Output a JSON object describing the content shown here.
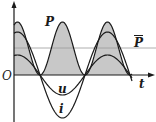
{
  "diagram": {
    "labels": {
      "origin": "O",
      "time_axis": "t",
      "power": "P",
      "average_power": "P",
      "voltage": "u",
      "current": "i"
    },
    "colors": {
      "curve": "#1a1a1a",
      "fill": "#c8c8c8",
      "avg_line": "#9a9a9a",
      "axis": "#1a1a1a"
    },
    "geometry": {
      "origin_x": 14,
      "axis_y": 75,
      "peak_x": 17.5,
      "half_period_px": 45,
      "x_end": 132,
      "power_peak_px": 53,
      "voltage_amp_px": 20,
      "current_amp_px": 43,
      "avg_power_y": 48
    }
  },
  "chart_data": {
    "type": "line",
    "title": "",
    "xlabel": "t",
    "ylabel": "",
    "series": [
      {
        "name": "u",
        "shape": "cosine",
        "amplitude_rel": 0.46
      },
      {
        "name": "i",
        "shape": "cosine, in phase with u",
        "amplitude_rel": 1.0
      },
      {
        "name": "P",
        "shape": "u·i, always ≥ 0, shaded",
        "amplitude_rel": 1.23
      },
      {
        "name": "P̄",
        "shape": "horizontal line at half of P peak"
      }
    ],
    "annotations": [
      "O",
      "t",
      "P",
      "P̄",
      "u",
      "i"
    ]
  }
}
